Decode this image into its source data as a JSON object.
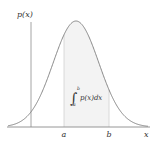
{
  "diagram": {
    "y_axis_label": "p(x)",
    "x_axis_label": "x",
    "interval": {
      "lower_label": "a",
      "upper_label": "b"
    },
    "integral": {
      "lower_limit": "a",
      "upper_limit": "b",
      "integrand": "p(x)dx"
    },
    "colors": {
      "curve": "#8a8a8a",
      "axis": "#9a9a9a",
      "shade": "#f4f4f4",
      "text": "#333333"
    }
  }
}
